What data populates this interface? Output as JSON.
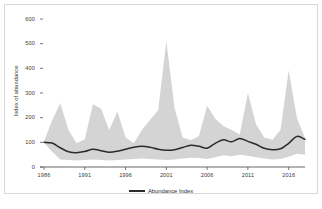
{
  "chart_data": {
    "type": "line",
    "title": "",
    "xlabel": "",
    "ylabel": "Index of abundance",
    "xlim": [
      1986,
      2018
    ],
    "ylim": [
      0,
      600
    ],
    "grid": false,
    "legend_position": "bottom-center",
    "x_ticks": [
      "1986",
      "1991",
      "1996",
      "2001",
      "2006",
      "2011",
      "2016"
    ],
    "x_tick_values": [
      1986,
      1991,
      1996,
      2001,
      2006,
      2011,
      2016
    ],
    "y_ticks": [
      "0",
      "100",
      "200",
      "300",
      "400",
      "500",
      "600"
    ],
    "y_tick_values": [
      0,
      100,
      200,
      300,
      400,
      500,
      600
    ],
    "x": [
      1986,
      1987,
      1988,
      1989,
      1990,
      1991,
      1992,
      1993,
      1994,
      1995,
      1996,
      1997,
      1998,
      1999,
      2000,
      2001,
      2002,
      2003,
      2004,
      2005,
      2006,
      2007,
      2008,
      2009,
      2010,
      2011,
      2012,
      2013,
      2014,
      2015,
      2016,
      2017,
      2018
    ],
    "series": [
      {
        "name": "Abundance Index",
        "color": "#2b2b2b",
        "values": [
          100,
          97,
          78,
          62,
          58,
          63,
          72,
          66,
          60,
          64,
          72,
          80,
          84,
          80,
          72,
          68,
          70,
          79,
          88,
          84,
          76,
          96,
          110,
          102,
          116,
          104,
          92,
          76,
          70,
          74,
          96,
          124,
          112
        ]
      }
    ],
    "confidence_band": {
      "name": "Confidence interval",
      "color": "#cccccc",
      "opacity": 0.85,
      "lower": [
        98,
        62,
        30,
        28,
        26,
        28,
        30,
        28,
        26,
        28,
        30,
        32,
        34,
        32,
        30,
        28,
        30,
        34,
        38,
        36,
        32,
        40,
        48,
        44,
        50,
        46,
        40,
        34,
        30,
        32,
        42,
        54,
        50
      ],
      "upper": [
        104,
        190,
        258,
        150,
        96,
        112,
        254,
        236,
        150,
        226,
        120,
        96,
        150,
        192,
        230,
        510,
        240,
        120,
        108,
        126,
        248,
        196,
        166,
        150,
        132,
        300,
        172,
        120,
        110,
        150,
        392,
        200,
        118
      ]
    },
    "legend": [
      {
        "label": "Abundance Index",
        "color": "#2b2b2b"
      }
    ]
  }
}
